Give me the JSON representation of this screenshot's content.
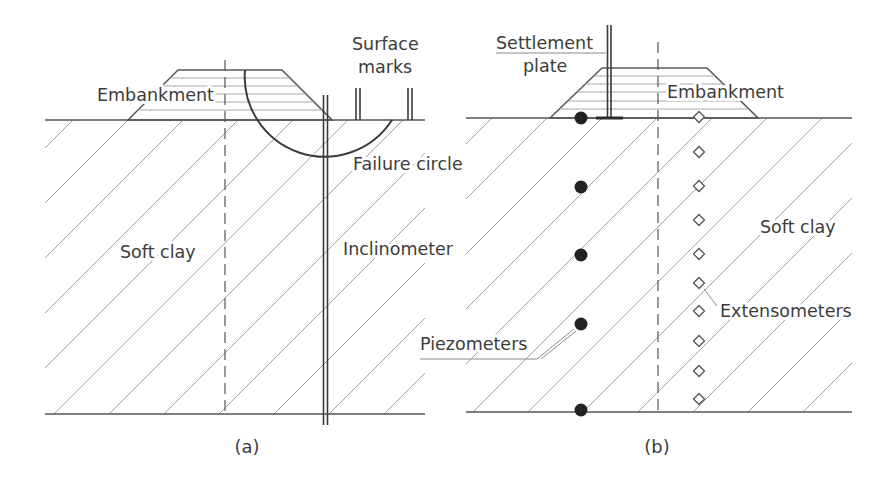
{
  "panel_a": {
    "caption": "(a)",
    "embankment_label": "Embankment",
    "surface_marks_label": [
      "Surface",
      "marks"
    ],
    "failure_circle_label": "Failure circle",
    "soft_clay_label": "Soft clay",
    "inclinometer_label": "Inclinometer",
    "surface_marks": {
      "x": [
        358,
        410
      ],
      "top_y": 88,
      "ground_y": 120
    }
  },
  "panel_b": {
    "caption": "(b)",
    "settlement_plate_label": [
      "Settlement",
      "plate"
    ],
    "embankment_label": "Embankment",
    "soft_clay_label": "Soft clay",
    "extensometers_label": "Extensometers",
    "piezometers_label": "Piezometers",
    "piezometers": {
      "x": 581,
      "y": [
        118,
        187,
        255,
        324,
        410
      ]
    },
    "extensometers": {
      "x": 699,
      "y": [
        117,
        152,
        186,
        220,
        254,
        283,
        311,
        341,
        371,
        399
      ]
    }
  },
  "colors": {
    "line": "#3a3a3a",
    "hatch": "#a0a0a0",
    "text": "#3c3c3c",
    "piezometer_fill": "#222222"
  }
}
